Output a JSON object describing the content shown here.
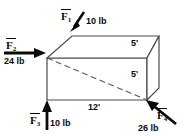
{
  "figure": {
    "box": {
      "stroke_color": "#3a3a3a",
      "fill_color": "#ffffff",
      "dimensions": [
        {
          "id": "depth-top",
          "label": "5'",
          "value": 5,
          "unit": "ft"
        },
        {
          "id": "height-front",
          "label": "5'",
          "value": 5,
          "unit": "ft"
        },
        {
          "id": "length-bottom",
          "label": "12'",
          "value": 12,
          "unit": "ft"
        }
      ]
    },
    "forces": [
      {
        "id": "F1",
        "symbol": "F",
        "subscript": "1",
        "magnitude_label": "10 lb",
        "magnitude": 10,
        "unit": "lb",
        "direction": "down-left",
        "arrow_color": "#0a0a0a"
      },
      {
        "id": "F2",
        "symbol": "F",
        "subscript": "2",
        "magnitude_label": "24 lb",
        "magnitude": 24,
        "unit": "lb",
        "direction": "right",
        "arrow_color": "#0a0a0a"
      },
      {
        "id": "F3",
        "symbol": "F",
        "subscript": "3",
        "magnitude_label": "10 lb",
        "magnitude": 10,
        "unit": "lb",
        "direction": "up",
        "arrow_color": "#0a0a0a"
      },
      {
        "id": "F4",
        "symbol": "F",
        "subscript": "4",
        "magnitude_label": "26 lb",
        "magnitude": 26,
        "unit": "lb",
        "direction": "up-left",
        "arrow_color": "#0a0a0a"
      }
    ]
  }
}
